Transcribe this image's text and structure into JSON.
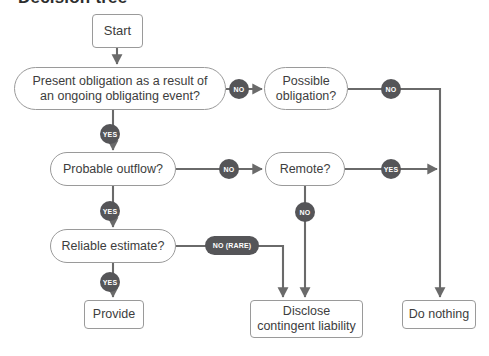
{
  "title": "Decision tree",
  "colors": {
    "badge_fill": "#555558",
    "badge_text": "#ffffff",
    "node_border": "#9a9a9a",
    "node_text": "#3d3d3d",
    "connector": "#6a6a6a",
    "background": "#ffffff"
  },
  "nodes": {
    "start": {
      "label": "Start",
      "x": 92,
      "y": 14,
      "w": 51,
      "h": 34,
      "shape": "terminal",
      "font": 13
    },
    "present_obligation": {
      "label": "Present obligation as a result of\nan ongoing obligating event?",
      "x": 14,
      "y": 67,
      "w": 212,
      "h": 43,
      "shape": "decision",
      "font": 12.5
    },
    "possible_obligation": {
      "label": "Possible\nobligation?",
      "x": 264,
      "y": 67,
      "w": 84,
      "h": 43,
      "shape": "decision",
      "font": 12.5
    },
    "probable_outflow": {
      "label": "Probable outflow?",
      "x": 50,
      "y": 152,
      "w": 126,
      "h": 34,
      "shape": "decision",
      "font": 12.5
    },
    "remote": {
      "label": "Remote?",
      "x": 265,
      "y": 152,
      "w": 80,
      "h": 34,
      "shape": "decision",
      "font": 12.5
    },
    "reliable_estimate": {
      "label": "Reliable estimate?",
      "x": 50,
      "y": 229,
      "w": 126,
      "h": 34,
      "shape": "decision",
      "font": 12.5
    },
    "provide": {
      "label": "Provide",
      "x": 84,
      "y": 300,
      "w": 60,
      "h": 29,
      "shape": "terminal",
      "font": 12.5
    },
    "disclose": {
      "label": "Disclose\ncontingent liability",
      "x": 250,
      "y": 300,
      "w": 113,
      "h": 38,
      "shape": "terminal",
      "font": 12.5
    },
    "do_nothing": {
      "label": "Do nothing",
      "x": 402,
      "y": 300,
      "w": 74,
      "h": 29,
      "shape": "terminal",
      "font": 12.5
    }
  },
  "badges": [
    {
      "id": "no-present-obligation",
      "label": "NO",
      "x": 229,
      "y": 79,
      "w": 20,
      "h": 20,
      "shape": "circle",
      "font": 7
    },
    {
      "id": "no-possible-obligation",
      "label": "NO",
      "x": 381,
      "y": 79,
      "w": 20,
      "h": 20,
      "shape": "circle",
      "font": 7
    },
    {
      "id": "yes-present-obligation",
      "label": "YES",
      "x": 100,
      "y": 124,
      "w": 20,
      "h": 20,
      "shape": "circle",
      "font": 7
    },
    {
      "id": "no-probable-outflow",
      "label": "NO",
      "x": 219,
      "y": 159,
      "w": 20,
      "h": 20,
      "shape": "circle",
      "font": 7
    },
    {
      "id": "yes-remote",
      "label": "YES",
      "x": 381,
      "y": 159,
      "w": 20,
      "h": 20,
      "shape": "circle",
      "font": 7
    },
    {
      "id": "no-remote",
      "label": "NO",
      "x": 295,
      "y": 202,
      "w": 20,
      "h": 20,
      "shape": "circle",
      "font": 7
    },
    {
      "id": "yes-probable-outflow",
      "label": "YES",
      "x": 100,
      "y": 201,
      "w": 20,
      "h": 20,
      "shape": "circle",
      "font": 7
    },
    {
      "id": "no-rare-reliable-estimate",
      "label": "NO (RARE)",
      "x": 205,
      "y": 236,
      "w": 54,
      "h": 19,
      "shape": "pill",
      "font": 7
    },
    {
      "id": "yes-reliable-estimate",
      "label": "YES",
      "x": 100,
      "y": 272,
      "w": 20,
      "h": 20,
      "shape": "circle",
      "font": 7
    }
  ],
  "connectors": [
    {
      "id": "start-to-present-obligation",
      "path": "M 117,48 L 117,64",
      "arrow": true
    },
    {
      "id": "present-obligation-no-to-possible-obligation",
      "path": "M 226,89 L 262,89",
      "arrow": true
    },
    {
      "id": "present-obligation-yes-to-probable-outflow",
      "path": "M 113,110 L 113,150",
      "arrow": true
    },
    {
      "id": "possible-obligation-no-to-right-rail",
      "path": "M 348,89 L 440,89 L 440,297",
      "arrow": true
    },
    {
      "id": "probable-outflow-no-to-remote",
      "path": "M 176,169 L 262,169",
      "arrow": true
    },
    {
      "id": "probable-outflow-yes-to-reliable-estimate",
      "path": "M 113,186 L 113,227",
      "arrow": true
    },
    {
      "id": "remote-yes-to-right-rail",
      "path": "M 345,169 L 437,169",
      "arrow": true
    },
    {
      "id": "remote-no-to-disclose",
      "path": "M 305,186 L 305,297",
      "arrow": true
    },
    {
      "id": "reliable-estimate-no-rare-to-disclose",
      "path": "M 176,246 L 283,246 L 283,297",
      "arrow": true
    },
    {
      "id": "reliable-estimate-yes-to-provide",
      "path": "M 113,263 L 113,297",
      "arrow": true
    }
  ]
}
